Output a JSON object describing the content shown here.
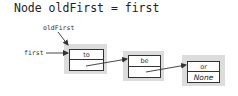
{
  "code_line": "Node oldFirst = first",
  "labels": {
    "old_first": "oldFirst",
    "first": "first"
  },
  "nodes": [
    {
      "item": "to",
      "next": ""
    },
    {
      "item": "be",
      "next": ""
    },
    {
      "item": "or",
      "next": "None"
    }
  ],
  "colors": {
    "node_shadow": "#dcdcdc",
    "stroke": "#333333"
  }
}
